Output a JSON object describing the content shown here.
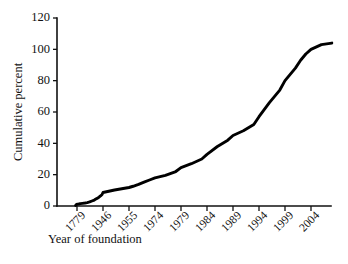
{
  "chart_data": {
    "type": "line",
    "title": "",
    "subtitle": "",
    "xlabel": "Year of foundation",
    "ylabel": "Cumulative percent",
    "xlim": [
      1770,
      2009
    ],
    "ylim": [
      0,
      120
    ],
    "yticks": [
      0,
      20,
      40,
      60,
      80,
      100,
      120
    ],
    "ytick_labels": [
      "0",
      "20",
      "40",
      "60",
      "80",
      "100",
      "120"
    ],
    "xtick_labels": [
      "1779",
      "1946",
      "1955",
      "1974",
      "1979",
      "1984",
      "1989",
      "1994",
      "1999",
      "2004"
    ],
    "xtick_years": [
      1779,
      1946,
      1955,
      1974,
      1979,
      1984,
      1989,
      1994,
      1999,
      2004
    ],
    "grid": false,
    "legend": false,
    "legend_position": "none",
    "series": [
      {
        "name": "Cumulative percent",
        "color": "#000000",
        "x": [
          1770,
          1775,
          1779,
          1790,
          1800,
          1815,
          1830,
          1845,
          1860,
          1875,
          1890,
          1900,
          1910,
          1920,
          1930,
          1940,
          1946,
          1950,
          1955,
          1958,
          1962,
          1966,
          1970,
          1974,
          1976,
          1978,
          1979,
          1981,
          1983,
          1984,
          1986,
          1988,
          1989,
          1991,
          1993,
          1994,
          1996,
          1998,
          1999,
          2001,
          2002,
          2003,
          2004,
          2006,
          2008
        ],
        "values": [
          0.4,
          0.8,
          1.2,
          1.3,
          1.5,
          1.7,
          1.9,
          2.2,
          2.6,
          3.2,
          3.8,
          4.4,
          5.0,
          5.6,
          6.4,
          7.4,
          8.6,
          10.2,
          11.8,
          12.6,
          13.8,
          15.2,
          16.6,
          18.0,
          19.6,
          22.0,
          24.5,
          27.0,
          30.0,
          33.0,
          38.0,
          42.0,
          45.0,
          48.0,
          52.0,
          57.0,
          66.0,
          74.0,
          80.0,
          88.0,
          93.0,
          97.0,
          100.0,
          103.0,
          104.0
        ]
      }
    ]
  },
  "axes": {
    "y_title": "Cumulative percent",
    "x_title": "Year of foundation"
  }
}
